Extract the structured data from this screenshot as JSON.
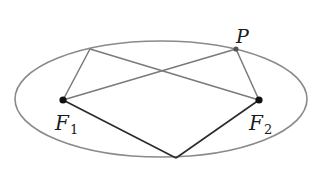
{
  "diagram": {
    "title": "",
    "colors": {
      "ellipse": "#8a8a8a",
      "gray_lines": "#7a7a7a",
      "dark_lines": "#2a2a2a",
      "points": "#111111",
      "labels": "#1a1a1a"
    },
    "ellipse": {
      "cx": 161,
      "cy": 99,
      "rx": 146,
      "ry": 58
    },
    "points": {
      "F1": {
        "x": 63,
        "y": 100,
        "label": "F",
        "subscript": "1"
      },
      "F2": {
        "x": 259,
        "y": 100,
        "label": "F",
        "subscript": "2"
      },
      "P": {
        "x": 236,
        "y": 49,
        "label": "P"
      },
      "Q": {
        "x": 90,
        "y": 49
      },
      "R": {
        "x": 176,
        "y": 158
      }
    },
    "segments": [
      {
        "from": "F1",
        "to": "Q",
        "style": "gray"
      },
      {
        "from": "Q",
        "to": "F2",
        "style": "gray"
      },
      {
        "from": "F1",
        "to": "P",
        "style": "gray"
      },
      {
        "from": "P",
        "to": "F2",
        "style": "gray"
      },
      {
        "from": "F1",
        "to": "R",
        "style": "dark"
      },
      {
        "from": "R",
        "to": "F2",
        "style": "dark"
      }
    ],
    "labels": {
      "F1_main": "F",
      "F1_sub": "1",
      "F2_main": "F",
      "F2_sub": "2",
      "P": "P"
    }
  }
}
